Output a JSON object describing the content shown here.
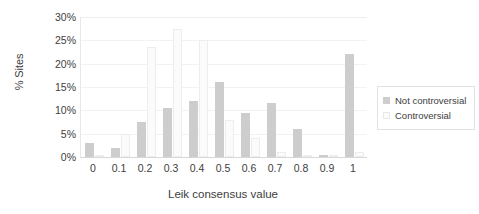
{
  "chart_data": {
    "type": "bar",
    "title": "",
    "subtitle": "",
    "xlabel": "Leik consensus value",
    "ylabel": "% Sites",
    "categories": [
      "0",
      "0.1",
      "0.2",
      "0.3",
      "0.4",
      "0.5",
      "0.6",
      "0.7",
      "0.8",
      "0.9",
      "1"
    ],
    "series": [
      {
        "name": "Not controversial",
        "color": "#cdcdcd",
        "values": [
          3,
          2,
          7.5,
          10.5,
          12,
          16,
          9.5,
          11.5,
          6,
          0.5,
          22
        ]
      },
      {
        "name": "Controversial",
        "color": "#fbfbfb",
        "values": [
          0.3,
          5,
          23.5,
          27.5,
          25,
          8,
          4,
          1,
          0.5,
          0,
          1
        ]
      }
    ],
    "ylim": [
      0,
      30
    ],
    "ytick_labels": [
      "0%",
      "5%",
      "10%",
      "15%",
      "20%",
      "25%",
      "30%"
    ],
    "ytick_values": [
      0,
      5,
      10,
      15,
      20,
      25,
      30
    ],
    "grid": true,
    "grid_axis": "y",
    "legend_position": "right"
  },
  "legend": {
    "entries": [
      {
        "label": "Not controversial"
      },
      {
        "label": "Controversial"
      }
    ]
  }
}
